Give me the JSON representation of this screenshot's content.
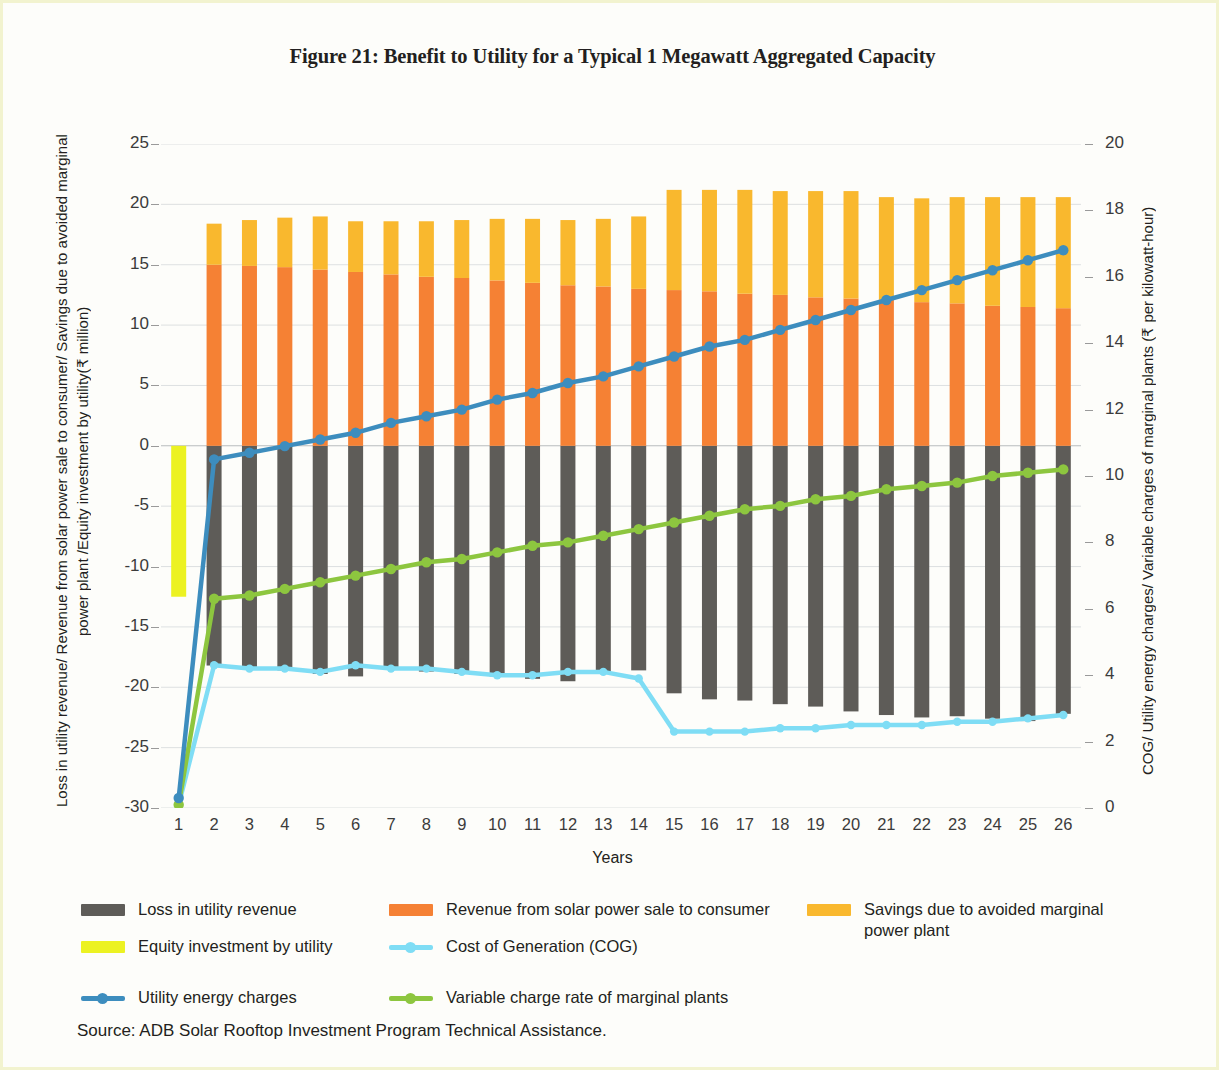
{
  "figure": {
    "title": "Figure 21: Benefit to Utility for a Typical 1 Megawatt Aggregated Capacity",
    "source": "Source: ADB Solar Rooftop Investment Program Technical Assistance."
  },
  "legend": {
    "items": [
      {
        "label": "Loss in utility revenue",
        "color": "#5E5C58",
        "marker": "bar"
      },
      {
        "label": "Revenue from solar power sale to consumer",
        "color": "#F58134",
        "marker": "bar"
      },
      {
        "label": "Savings due to avoided marginal power plant",
        "color": "#F9B82E",
        "marker": "bar"
      },
      {
        "label": "Equity investment by utility",
        "color": "#ECF222",
        "marker": "bar"
      },
      {
        "label": "Cost of Generation (COG)",
        "color": "#7FDDF5",
        "marker": "line"
      },
      {
        "label": "Utility energy charges",
        "color": "#3D8DBE",
        "marker": "line"
      },
      {
        "label": "Variable charge rate of marginal plants",
        "color": "#8DC63F",
        "marker": "line"
      }
    ]
  },
  "chart_data": {
    "type": "bar",
    "title": "Figure 21: Benefit to Utility for a Typical 1 Megawatt Aggregated Capacity",
    "xlabel": "Years",
    "ylabel": "Loss in utility revenue/ Revenue from solar power sale to consumer/ Savings due to avoided marginal power plant /Equity investment by utility(₹ million)",
    "y2label": "COG/ Utility energy charges/ Variable charges of marginal plants (₹ per kilowatt-hour)",
    "grid": true,
    "legend_position": "bottom",
    "ylim": [
      -30,
      25
    ],
    "y2lim": [
      0,
      20
    ],
    "yticks": [
      25,
      20,
      15,
      10,
      5,
      0,
      -5,
      -10,
      -15,
      -20,
      -25,
      -30
    ],
    "y2ticks": [
      20,
      18,
      16,
      14,
      12,
      10,
      8,
      6,
      4,
      2,
      0
    ],
    "categories": [
      1,
      2,
      3,
      4,
      5,
      6,
      7,
      8,
      9,
      10,
      11,
      12,
      13,
      14,
      15,
      16,
      17,
      18,
      19,
      20,
      21,
      22,
      23,
      24,
      25,
      26
    ],
    "series": [
      {
        "name": "Equity investment by utility",
        "type": "bar",
        "axis": "left",
        "color": "#ECF222",
        "values": [
          -12.5,
          0,
          0,
          0,
          0,
          0,
          0,
          0,
          0,
          0,
          0,
          0,
          0,
          0,
          0,
          0,
          0,
          0,
          0,
          0,
          0,
          0,
          0,
          0,
          0,
          0
        ]
      },
      {
        "name": "Loss in utility revenue",
        "type": "bar",
        "axis": "left",
        "color": "#5E5C58",
        "values": [
          0,
          -18.2,
          -18.5,
          -18.6,
          -18.9,
          -19.1,
          -18.5,
          -18.7,
          -18.9,
          -19.1,
          -19.3,
          -19.5,
          -18.9,
          -18.6,
          -20.5,
          -21.0,
          -21.1,
          -21.4,
          -21.6,
          -22.0,
          -22.3,
          -22.5,
          -22.4,
          -22.6,
          -22.8,
          -22.2
        ]
      },
      {
        "name": "Revenue from solar power sale to consumer",
        "type": "bar",
        "axis": "left",
        "color": "#F58134",
        "values": [
          0,
          15.0,
          14.9,
          14.8,
          14.6,
          14.4,
          14.2,
          14.0,
          13.9,
          13.7,
          13.5,
          13.3,
          13.2,
          13.0,
          12.9,
          12.8,
          12.6,
          12.5,
          12.3,
          12.2,
          12.1,
          11.9,
          11.8,
          11.6,
          11.5,
          11.4
        ]
      },
      {
        "name": "Savings due to avoided marginal power plant",
        "type": "bar",
        "axis": "left",
        "color": "#F9B82E",
        "values": [
          0,
          3.4,
          3.8,
          4.1,
          4.4,
          4.2,
          4.4,
          4.6,
          4.8,
          5.1,
          5.3,
          5.4,
          5.6,
          6.0,
          8.3,
          8.4,
          8.6,
          8.6,
          8.8,
          8.9,
          8.5,
          8.6,
          8.8,
          9.0,
          9.1,
          9.2
        ]
      },
      {
        "name": "Utility energy charges",
        "type": "line",
        "axis": "right",
        "color": "#3D8DBE",
        "values": [
          0.3,
          10.5,
          10.7,
          10.9,
          11.1,
          11.3,
          11.6,
          11.8,
          12.0,
          12.3,
          12.5,
          12.8,
          13.0,
          13.3,
          13.6,
          13.9,
          14.1,
          14.4,
          14.7,
          15.0,
          15.3,
          15.6,
          15.9,
          16.2,
          16.5,
          16.8
        ]
      },
      {
        "name": "Variable charge rate of marginal plants",
        "type": "line",
        "axis": "right",
        "color": "#8DC63F",
        "values": [
          0.1,
          6.3,
          6.4,
          6.6,
          6.8,
          7.0,
          7.2,
          7.4,
          7.5,
          7.7,
          7.9,
          8.0,
          8.2,
          8.4,
          8.6,
          8.8,
          9.0,
          9.1,
          9.3,
          9.4,
          9.6,
          9.7,
          9.8,
          10.0,
          10.1,
          10.2
        ]
      },
      {
        "name": "Cost of Generation (COG)",
        "type": "line",
        "axis": "right",
        "color": "#7FDDF5",
        "values": [
          0.1,
          4.3,
          4.2,
          4.2,
          4.1,
          4.3,
          4.2,
          4.2,
          4.1,
          4.0,
          4.0,
          4.1,
          4.1,
          3.9,
          2.3,
          2.3,
          2.3,
          2.4,
          2.4,
          2.5,
          2.5,
          2.5,
          2.6,
          2.6,
          2.7,
          2.8
        ]
      }
    ]
  }
}
